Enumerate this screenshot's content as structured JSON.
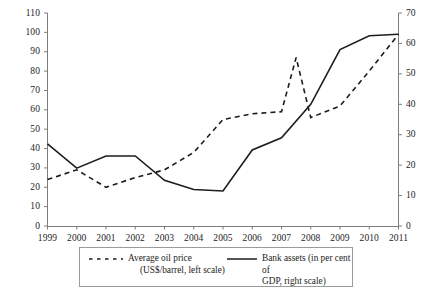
{
  "chart_data": {
    "type": "line",
    "title": "",
    "xlabel": "",
    "ylabel": "",
    "grid": false,
    "legend_position": "bottom",
    "x": [
      1999,
      2000,
      2001,
      2002,
      2003,
      2004,
      2005,
      2006,
      2007,
      2008,
      2009,
      2010,
      2011
    ],
    "xticklabels": [
      "1999",
      "2000",
      "2001",
      "2002",
      "2003",
      "2004",
      "2005",
      "2006",
      "2007",
      "2008",
      "2009",
      "2010",
      "2011"
    ],
    "left_axis": {
      "label": "Average oil price (US$/barrel)",
      "ylim": [
        0,
        110
      ],
      "ticks": [
        0,
        10,
        20,
        30,
        40,
        50,
        60,
        70,
        80,
        90,
        100,
        110
      ],
      "ticklabels": [
        "0",
        "10",
        "20",
        "30",
        "40",
        "50",
        "60",
        "70",
        "80",
        "90",
        "100",
        "110"
      ]
    },
    "right_axis": {
      "label": "Bank assets (in per cent of GDP)",
      "ylim": [
        0,
        70
      ],
      "ticks": [
        0,
        10,
        20,
        30,
        40,
        50,
        60,
        70
      ],
      "ticklabels": [
        "0",
        "10",
        "20",
        "30",
        "40",
        "50",
        "60",
        "70"
      ]
    },
    "series": [
      {
        "name": "Average oil price (US$/barrel, left scale)",
        "axis": "left",
        "style": "dashed",
        "color": "#1d1d1d",
        "x": [
          1999,
          2000,
          2001,
          2002,
          2003,
          2004,
          2005,
          2006,
          2007,
          2007.5,
          2008,
          2009,
          2010,
          2011
        ],
        "values": [
          24,
          29,
          20,
          25,
          29,
          38,
          55,
          58,
          59,
          87,
          56,
          62,
          80,
          99
        ]
      },
      {
        "name": "Bank assets (in per cent of GDP, right scale)",
        "axis": "right",
        "style": "solid",
        "color": "#1d1d1d",
        "x": [
          1999,
          2000,
          2001,
          2002,
          2003,
          2004,
          2005,
          2006,
          2007,
          2008,
          2009,
          2010,
          2011
        ],
        "values": [
          27,
          19,
          23,
          23,
          15,
          12,
          11.5,
          25,
          29,
          40,
          58,
          62.5,
          63
        ]
      }
    ]
  },
  "legend": {
    "oil": {
      "line1": "Average oil price",
      "line2": "(US$/barrel, left scale)"
    },
    "bank": {
      "line1": "Bank assets (in per cent of",
      "line2": "GDP, right scale)"
    }
  }
}
